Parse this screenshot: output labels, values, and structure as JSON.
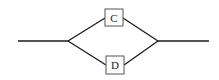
{
  "diagram": {
    "type": "parallel-system",
    "nodes": [
      {
        "id": "C",
        "label": "C"
      },
      {
        "id": "D",
        "label": "D"
      }
    ],
    "line_color": "#1a1a1a",
    "box_border_color": "#555555"
  }
}
